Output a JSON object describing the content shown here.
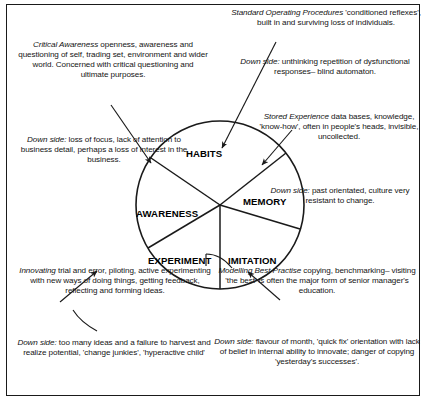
{
  "diagram": {
    "segments": [
      {
        "id": "habits",
        "label": "HABITS"
      },
      {
        "id": "memory",
        "label": "MEMORY"
      },
      {
        "id": "imitation",
        "label": "IMITATION"
      },
      {
        "id": "experiment",
        "label": "EXPERIMENT"
      },
      {
        "id": "awareness",
        "label": "AWARENESS"
      }
    ],
    "stroke_color": "#1a1a1a",
    "fill_color": "#ffffff",
    "notes": {
      "standard_operating_procedures": {
        "lead": "Standard Operating Procedures",
        "body": " 'conditioned reflexes', built in and surviving loss of individuals."
      },
      "habits_down_side": {
        "lead": "Down side:",
        "body": " unthinking repetition of dysfunctional responses– blind automaton."
      },
      "stored_experience": {
        "lead": "Stored Experience",
        "body": " data bases, knowledge, 'know-how', often in people's heads, invisible, uncollected."
      },
      "memory_down_side": {
        "lead": "Down side:",
        "body": " past orientated, culture very resistant to change."
      },
      "critical_awareness": {
        "lead": "Critical Awareness",
        "body": " openness, awareness and questioning of self, trading set, environment and wider world. Concerned with critical questioning and ultimate purposes."
      },
      "awareness_down_side": {
        "lead": "Down side:",
        "body": " loss of focus, lack of attention to business detail, perhaps a loss of interest in the business."
      },
      "innovating": {
        "lead": "Innovating",
        "body": " trial and error, piloting, active experimenting with new ways of doing things, getting feedback, reflecting and forming ideas."
      },
      "experiment_down_side": {
        "lead": "Down side:",
        "body": " too many ideas and a failure to harvest and realize potential, 'change junkies', 'hyperactive child'"
      },
      "modelling_best_practise": {
        "lead": "Modelling Best Practise",
        "body": " copying, benchmarking– visiting 'the best' is often the major form of senior manager's education."
      },
      "imitation_down_side": {
        "lead": "Down side:",
        "body": " flavour of month, 'quick fix' orientation with lack of belief in internal ability to innovate; danger of copying 'yesterday's successes'."
      }
    }
  }
}
